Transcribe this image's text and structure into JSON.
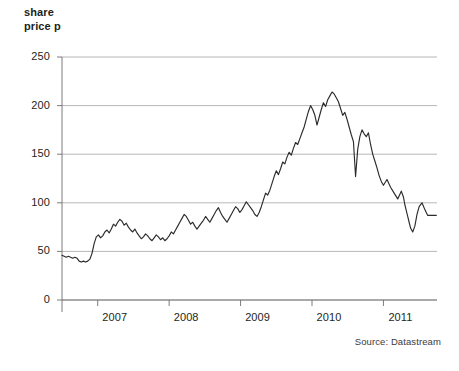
{
  "figure": {
    "source_note": "Source: Datastream",
    "axis_title": "share\nprice p",
    "background_color": "#ffffff",
    "line_color": "#2b2b2b",
    "grid_color": "#9a9a9a"
  },
  "chart_data": {
    "type": "line",
    "title": "",
    "subtitle": "",
    "xlabel": "",
    "ylabel": "share price p",
    "ylim": [
      0,
      250
    ],
    "xlim": [
      2006.5,
      2011.75
    ],
    "grid": true,
    "legend": null,
    "y_ticks": [
      0,
      50,
      100,
      150,
      200,
      250
    ],
    "y_tick_labels": [
      "0",
      "50",
      "100",
      "150",
      "200",
      "250"
    ],
    "x_ticks": [
      2007,
      2008,
      2009,
      2010,
      2011
    ],
    "x_tick_labels": [
      "2007",
      "2008",
      "2009",
      "2010",
      "2011"
    ],
    "annotations": [
      "Source: Datastream"
    ],
    "series": [
      {
        "name": "share price",
        "color": "#2b2b2b",
        "x": [
          2006.5,
          2006.53,
          2006.56,
          2006.59,
          2006.62,
          2006.65,
          2006.68,
          2006.71,
          2006.74,
          2006.77,
          2006.8,
          2006.83,
          2006.86,
          2006.89,
          2006.92,
          2006.95,
          2006.98,
          2007.01,
          2007.04,
          2007.07,
          2007.1,
          2007.13,
          2007.16,
          2007.19,
          2007.22,
          2007.25,
          2007.28,
          2007.31,
          2007.34,
          2007.37,
          2007.4,
          2007.43,
          2007.46,
          2007.49,
          2007.52,
          2007.55,
          2007.58,
          2007.61,
          2007.64,
          2007.67,
          2007.7,
          2007.73,
          2007.76,
          2007.79,
          2007.82,
          2007.85,
          2007.88,
          2007.91,
          2007.94,
          2007.97,
          2008.0,
          2008.03,
          2008.06,
          2008.09,
          2008.12,
          2008.15,
          2008.18,
          2008.21,
          2008.24,
          2008.27,
          2008.3,
          2008.33,
          2008.36,
          2008.39,
          2008.42,
          2008.45,
          2008.48,
          2008.51,
          2008.54,
          2008.57,
          2008.6,
          2008.63,
          2008.66,
          2008.69,
          2008.72,
          2008.75,
          2008.78,
          2008.81,
          2008.84,
          2008.87,
          2008.9,
          2008.93,
          2008.96,
          2008.99,
          2009.02,
          2009.05,
          2009.08,
          2009.11,
          2009.14,
          2009.17,
          2009.2,
          2009.23,
          2009.26,
          2009.29,
          2009.32,
          2009.35,
          2009.38,
          2009.41,
          2009.44,
          2009.47,
          2009.5,
          2009.53,
          2009.56,
          2009.59,
          2009.62,
          2009.65,
          2009.68,
          2009.71,
          2009.74,
          2009.77,
          2009.8,
          2009.83,
          2009.86,
          2009.89,
          2009.92,
          2009.95,
          2009.98,
          2010.01,
          2010.04,
          2010.07,
          2010.1,
          2010.13,
          2010.16,
          2010.19,
          2010.22,
          2010.25,
          2010.28,
          2010.31,
          2010.34,
          2010.37,
          2010.4,
          2010.43,
          2010.46,
          2010.49,
          2010.52,
          2010.55,
          2010.58,
          2010.61,
          2010.64,
          2010.67,
          2010.7,
          2010.73,
          2010.76,
          2010.79,
          2010.82,
          2010.85,
          2010.88,
          2010.91,
          2010.94,
          2010.97,
          2011.0,
          2011.05,
          2011.1,
          2011.15,
          2011.2,
          2011.25,
          2011.28,
          2011.3,
          2011.32,
          2011.34,
          2011.36,
          2011.38,
          2011.41,
          2011.44,
          2011.47,
          2011.5,
          2011.54,
          2011.58,
          2011.62,
          2011.66,
          2011.7,
          2011.74
        ],
        "y": [
          46,
          45,
          44,
          45,
          44,
          43,
          44,
          43,
          40,
          39,
          40,
          39,
          40,
          42,
          48,
          58,
          65,
          67,
          64,
          66,
          70,
          72,
          69,
          73,
          78,
          76,
          80,
          83,
          81,
          77,
          79,
          75,
          72,
          70,
          73,
          69,
          66,
          63,
          65,
          68,
          66,
          63,
          61,
          64,
          67,
          65,
          62,
          64,
          61,
          63,
          66,
          70,
          68,
          72,
          76,
          80,
          84,
          88,
          86,
          82,
          78,
          80,
          76,
          73,
          76,
          79,
          82,
          86,
          83,
          80,
          84,
          88,
          92,
          95,
          90,
          86,
          83,
          80,
          84,
          88,
          92,
          96,
          94,
          90,
          93,
          97,
          101,
          98,
          95,
          92,
          88,
          86,
          90,
          96,
          103,
          110,
          108,
          113,
          120,
          127,
          133,
          129,
          135,
          142,
          140,
          147,
          152,
          149,
          156,
          162,
          160,
          166,
          172,
          178,
          186,
          194,
          200,
          196,
          190,
          180,
          188,
          196,
          203,
          199,
          206,
          210,
          214,
          212,
          208,
          204,
          197,
          190,
          193,
          186,
          178,
          170,
          163,
          127,
          155,
          168,
          175,
          171,
          168,
          172,
          160,
          150,
          143,
          136,
          128,
          122,
          118,
          124,
          116,
          110,
          104,
          112,
          106,
          98,
          92,
          86,
          80,
          74,
          70,
          76,
          88,
          96,
          100,
          93,
          87,
          87,
          87,
          87
        ]
      },
      {
        "name": "share price (plateau)",
        "color": "#2b2b2b",
        "x": [
          2011.12,
          2011.46
        ],
        "y": [
          87,
          87
        ]
      }
    ],
    "events": [
      {
        "label": "initial dip",
        "x": 2006.78,
        "y": 39
      },
      {
        "label": "peak",
        "x": 2009.86,
        "y": 215
      },
      {
        "label": "sharp spike low",
        "x": 2010.37,
        "y": 125
      },
      {
        "label": "suspension plateau",
        "x": 2011.3,
        "y": 87
      },
      {
        "label": "collapse",
        "x": 2011.5,
        "y": 5
      }
    ]
  }
}
